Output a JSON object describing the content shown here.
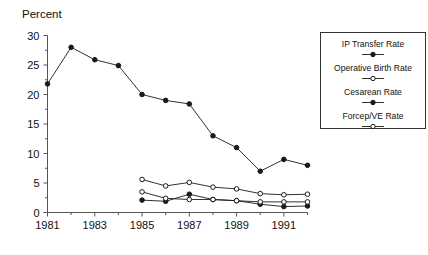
{
  "chart_data": {
    "type": "line",
    "title": "",
    "ylabel": "Percent",
    "xlabel": "",
    "xlim": [
      1981,
      1992
    ],
    "ylim": [
      0,
      30
    ],
    "grid": false,
    "legend_position": "right",
    "xticks": [
      1981,
      1983,
      1985,
      1987,
      1989,
      1991
    ],
    "xtick_labels": [
      "1981",
      "1983",
      "1985",
      "1987",
      "1989",
      "1991"
    ],
    "yticks": [
      0,
      5,
      10,
      15,
      20,
      25,
      30
    ],
    "ytick_labels": [
      "0",
      "5",
      "10",
      "15",
      "20",
      "25",
      "30"
    ],
    "minor_xticks": [
      1982,
      1984,
      1986,
      1988,
      1990,
      1992
    ],
    "minor_yticks": [
      2.5,
      7.5,
      12.5,
      17.5,
      22.5,
      27.5
    ],
    "series": [
      {
        "name": "IP Transfer Rate",
        "marker": "filled-circle",
        "x": [
          1981,
          1982,
          1983,
          1984,
          1985,
          1986,
          1987,
          1988,
          1989,
          1990,
          1991,
          1992
        ],
        "values": [
          21.8,
          28.0,
          25.9,
          24.9,
          20.0,
          19.0,
          18.4,
          13.0,
          11.0,
          7.0,
          9.0,
          8.0
        ]
      },
      {
        "name": "Operative Birth Rate",
        "marker": "open-circle",
        "x": [
          1985,
          1986,
          1987,
          1988,
          1989,
          1990,
          1991,
          1992
        ],
        "values": [
          5.6,
          4.5,
          5.1,
          4.3,
          4.0,
          3.2,
          3.0,
          3.1
        ]
      },
      {
        "name": "Cesarean Rate",
        "marker": "filled-circle",
        "x": [
          1985,
          1986,
          1987,
          1988,
          1989,
          1990,
          1991,
          1992
        ],
        "values": [
          2.1,
          1.9,
          3.1,
          2.2,
          2.0,
          1.4,
          1.0,
          1.1
        ]
      },
      {
        "name": "Forcep/VE Rate",
        "marker": "open-circle",
        "x": [
          1985,
          1986,
          1987,
          1988,
          1989,
          1990,
          1991,
          1992
        ],
        "values": [
          3.5,
          2.4,
          2.2,
          2.2,
          2.0,
          1.8,
          1.8,
          1.8
        ]
      }
    ]
  },
  "legend": {
    "entries": [
      {
        "label": "IP Transfer Rate",
        "marker": "filled-circle"
      },
      {
        "label": "Operative Birth Rate",
        "marker": "open-circle"
      },
      {
        "label": "Cesarean Rate",
        "marker": "filled-circle"
      },
      {
        "label": "Forcep/VE Rate",
        "marker": "open-circle"
      }
    ]
  },
  "axis": {
    "y_title": "Percent"
  },
  "colors": {
    "line": "#1a1a1a",
    "axis": "#555555",
    "background": "#ffffff",
    "legend_border": "#333333"
  }
}
